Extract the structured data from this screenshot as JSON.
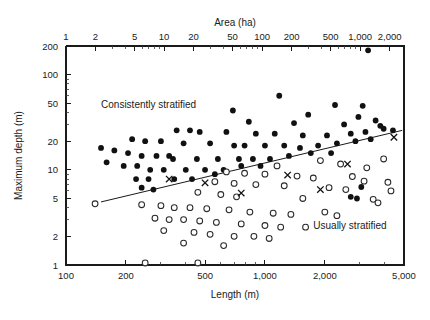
{
  "figure": {
    "top_axis_title": "Area (ha)",
    "bottom_axis_title": "Length (m)",
    "left_axis_title": "Maximum depth (m)",
    "region_label_upper": "Consistently stratified",
    "region_label_lower": "Usually stratified"
  },
  "chart_data": {
    "type": "scatter",
    "title": "",
    "xlabel": "Length (m)",
    "ylabel": "Maximum depth (m)",
    "x_scale": "log",
    "y_scale": "log",
    "xlim": [
      100,
      5000
    ],
    "ylim": [
      1,
      200
    ],
    "grid": false,
    "legend": "none",
    "x_ticks": [
      100,
      200,
      500,
      1000,
      2000,
      5000
    ],
    "x_tick_labels": [
      "100",
      "200",
      "500",
      "1,000",
      "2,000",
      "5,000"
    ],
    "y_ticks": [
      1,
      2,
      5,
      10,
      20,
      50,
      100,
      200
    ],
    "y_tick_labels": [
      "1",
      "2",
      "5",
      "10",
      "20",
      "50",
      "100",
      "200"
    ],
    "secondary_x_axis": {
      "label": "Area (ha)",
      "position": "top",
      "scale": "log",
      "lim": [
        1,
        2800
      ],
      "ticks": [
        1,
        2,
        5,
        10,
        20,
        50,
        100,
        200,
        500,
        1000,
        2000
      ],
      "tick_labels": [
        "1",
        "2",
        "5",
        "10",
        "20",
        "50",
        "100",
        "200",
        "500",
        "1,000",
        "2,000"
      ]
    },
    "annotations": [
      {
        "text": "Consistently stratified",
        "x": 150,
        "y": 45
      },
      {
        "text": "Usually stratified",
        "x": 1750,
        "y": 2.4
      }
    ],
    "fit_line": {
      "x": [
        150,
        4900
      ],
      "y": [
        4.6,
        26.0
      ]
    },
    "series": [
      {
        "name": "Consistently stratified",
        "marker": "filled-circle",
        "color": "#111111",
        "points": [
          [
            3300,
            180
          ],
          [
            1180,
            60
          ],
          [
            2250,
            48
          ],
          [
            3100,
            47
          ],
          [
            690,
            42
          ],
          [
            1650,
            38
          ],
          [
            2950,
            36
          ],
          [
            3600,
            33
          ],
          [
            830,
            32
          ],
          [
            1400,
            31
          ],
          [
            2500,
            30
          ],
          [
            3800,
            29
          ],
          [
            360,
            26
          ],
          [
            420,
            26
          ],
          [
            470,
            25
          ],
          [
            640,
            25
          ],
          [
            900,
            24
          ],
          [
            1120,
            24
          ],
          [
            1550,
            23
          ],
          [
            2050,
            23
          ],
          [
            2700,
            24
          ],
          [
            3200,
            25
          ],
          [
            3950,
            27
          ],
          [
            4400,
            26
          ],
          [
            215,
            21
          ],
          [
            250,
            20
          ],
          [
            300,
            20
          ],
          [
            390,
            19
          ],
          [
            530,
            19
          ],
          [
            700,
            18
          ],
          [
            790,
            18
          ],
          [
            1000,
            18
          ],
          [
            1250,
            18
          ],
          [
            1500,
            17
          ],
          [
            1850,
            18
          ],
          [
            2300,
            19
          ],
          [
            2850,
            20
          ],
          [
            3400,
            21
          ],
          [
            150,
            17
          ],
          [
            175,
            16
          ],
          [
            205,
            15
          ],
          [
            240,
            14
          ],
          [
            285,
            14
          ],
          [
            330,
            14
          ],
          [
            345,
            13
          ],
          [
            455,
            13
          ],
          [
            580,
            13
          ],
          [
            740,
            13
          ],
          [
            870,
            13
          ],
          [
            1060,
            13
          ],
          [
            1320,
            14
          ],
          [
            1700,
            15
          ],
          [
            2150,
            15
          ],
          [
            160,
            12
          ],
          [
            195,
            11
          ],
          [
            228,
            11
          ],
          [
            265,
            10
          ],
          [
            310,
            10
          ],
          [
            400,
            10
          ],
          [
            500,
            10
          ],
          [
            620,
            10
          ],
          [
            760,
            11
          ],
          [
            950,
            11
          ],
          [
            225,
            8
          ],
          [
            260,
            8
          ],
          [
            350,
            8
          ],
          [
            430,
            8
          ],
          [
            560,
            9
          ],
          [
            240,
            6.5
          ],
          [
            275,
            6.2
          ],
          [
            2700,
            5.2
          ],
          [
            2900,
            5.0
          ],
          [
            3050,
            6.6
          ]
        ]
      },
      {
        "name": "Usually stratified",
        "marker": "open-circle",
        "color": "#2b2b2b",
        "points": [
          [
            3950,
            13.0
          ],
          [
            1900,
            12.5
          ],
          [
            2400,
            11.5
          ],
          [
            1150,
            11.0
          ],
          [
            3250,
            10.5
          ],
          [
            640,
            9.5
          ],
          [
            790,
            9.2
          ],
          [
            1000,
            9.0
          ],
          [
            1450,
            8.6
          ],
          [
            1750,
            8.2
          ],
          [
            2750,
            8.5
          ],
          [
            3150,
            7.6
          ],
          [
            560,
            7.5
          ],
          [
            700,
            7.2
          ],
          [
            900,
            7.0
          ],
          [
            1250,
            6.8
          ],
          [
            2100,
            6.5
          ],
          [
            2550,
            6.2
          ],
          [
            4300,
            6.0
          ],
          [
            4150,
            7.4
          ],
          [
            140,
            4.4
          ],
          [
            460,
            5.8
          ],
          [
            600,
            5.5
          ],
          [
            720,
            5.2
          ],
          [
            1550,
            5.0
          ],
          [
            3500,
            4.9
          ],
          [
            3700,
            4.5
          ],
          [
            240,
            4.3
          ],
          [
            300,
            4.2
          ],
          [
            350,
            4.0
          ],
          [
            420,
            4.0
          ],
          [
            510,
            3.9
          ],
          [
            660,
            3.8
          ],
          [
            840,
            3.6
          ],
          [
            1100,
            3.5
          ],
          [
            1350,
            3.4
          ],
          [
            2000,
            3.6
          ],
          [
            2300,
            3.3
          ],
          [
            280,
            3.1
          ],
          [
            330,
            3.0
          ],
          [
            390,
            3.0
          ],
          [
            470,
            2.9
          ],
          [
            570,
            2.8
          ],
          [
            760,
            2.7
          ],
          [
            1000,
            2.6
          ],
          [
            1200,
            2.5
          ],
          [
            1600,
            2.5
          ],
          [
            310,
            2.3
          ],
          [
            440,
            2.2
          ],
          [
            530,
            2.1
          ],
          [
            700,
            2.0
          ],
          [
            880,
            2.0
          ],
          [
            1050,
            1.9
          ],
          [
            390,
            1.7
          ],
          [
            620,
            1.6
          ],
          [
            250,
            1.05
          ],
          [
            460,
            1.05
          ]
        ]
      },
      {
        "name": "Intermediate",
        "marker": "cross",
        "color": "#111111",
        "points": [
          [
            330,
            8.0
          ],
          [
            500,
            7.3
          ],
          [
            760,
            5.7
          ],
          [
            1300,
            8.8
          ],
          [
            1900,
            6.2
          ],
          [
            2600,
            11.5
          ],
          [
            4450,
            22.0
          ]
        ]
      }
    ]
  }
}
